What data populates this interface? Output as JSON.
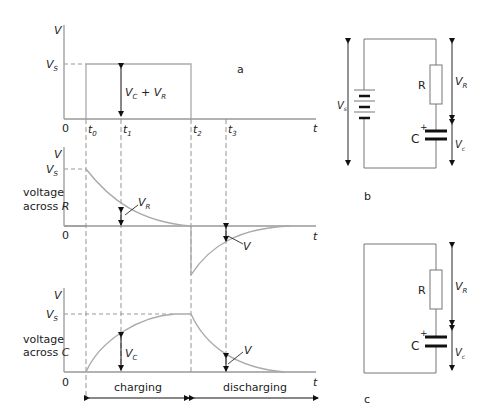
{
  "figure": {
    "panel_labels": {
      "a": "a",
      "b": "b",
      "c": "c"
    },
    "colors": {
      "axis": "#999999",
      "curve": "#aaaaaa",
      "text": "#222222",
      "component": "#111111"
    }
  },
  "graph_a": {
    "y_axis_label": "V",
    "vs_label": "V",
    "vs_sub": "S",
    "origin": "0",
    "x_axis_label": "t",
    "ticks": [
      {
        "base": "t",
        "sub": "0"
      },
      {
        "base": "t",
        "sub": "1"
      },
      {
        "base": "t",
        "sub": "2"
      },
      {
        "base": "t",
        "sub": "3"
      }
    ],
    "annotation": {
      "v1": "V",
      "s1": "C",
      "plus": " + ",
      "v2": "V",
      "s2": "R"
    }
  },
  "graph_r": {
    "y_axis_label": "V",
    "vs_label": "V",
    "vs_sub": "S",
    "origin": "0",
    "x_axis_label": "t",
    "side_label_line1": "voltage",
    "side_label_line2": "across ",
    "side_label_var": "R",
    "annotation_charge": {
      "v": "V",
      "s": "R"
    },
    "annotation_discharge": {
      "v": "V"
    }
  },
  "graph_c": {
    "y_axis_label": "V",
    "vs_label": "V",
    "vs_sub": "S",
    "origin": "0",
    "x_axis_label": "t",
    "side_label_line1": "voltage",
    "side_label_line2": "across ",
    "side_label_var": "C",
    "annotation_charge": {
      "v": "V",
      "s": "C"
    },
    "annotation_discharge": {
      "v": "V"
    }
  },
  "phases": {
    "charging": "charging",
    "discharging": "discharging"
  },
  "circuit_b": {
    "source_label": "V",
    "source_sub": "s",
    "resistor_label": "R",
    "capacitor_label": "C",
    "plus": "+",
    "vr_label": "V",
    "vr_sub": "R",
    "vc_label": "V",
    "vc_sub": "c"
  },
  "circuit_c": {
    "resistor_label": "R",
    "capacitor_label": "C",
    "plus": "+",
    "vr_label": "V",
    "vr_sub": "R",
    "vc_label": "V",
    "vc_sub": "c"
  }
}
